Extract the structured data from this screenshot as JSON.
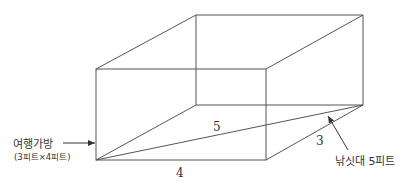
{
  "diagram": {
    "type": "3d-box-with-diagonal",
    "edge_color": "#555555",
    "labels": {
      "bag_title": "여행가방",
      "bag_dims": "(3피트×4피트)",
      "rod_label": "낚싯대 5피트",
      "diagonal_length": "5",
      "depth_length": "3",
      "width_length": "4"
    },
    "vertices": {
      "front_top_left": [
        96,
        69
      ],
      "front_top_right": [
        266,
        69
      ],
      "front_bottom_left": [
        96,
        160
      ],
      "front_bottom_right": [
        266,
        160
      ],
      "back_top_left": [
        196,
        15
      ],
      "back_top_right": [
        363,
        15
      ],
      "back_bottom_left": [
        196,
        105
      ],
      "back_bottom_right": [
        363,
        105
      ]
    }
  }
}
